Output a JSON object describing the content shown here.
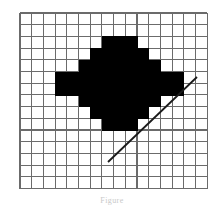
{
  "figure": {
    "caption": "Figure",
    "background_color": "#ffffff",
    "grid": {
      "line_color": "#6b6b6b",
      "line_width": 1.1,
      "origin_x": 20,
      "origin_y": 13,
      "cell_width": 11.7,
      "cell_height": 11.7,
      "columns": 16,
      "rows": 15
    },
    "shapes": [
      {
        "name": "rasterized-circle",
        "type": "filled-pixel-region",
        "fill_color": "#000000",
        "description": "Filled circular raster pattern, rows given as [row_index, start_col, end_col] inclusive in grid-cell coordinates",
        "pixel_rows": [
          [
            2,
            7,
            9
          ],
          [
            3,
            6,
            10
          ],
          [
            4,
            5,
            11
          ],
          [
            5,
            4,
            12
          ],
          [
            6,
            4,
            12
          ],
          [
            7,
            5,
            11
          ],
          [
            8,
            6,
            10
          ],
          [
            9,
            7,
            9
          ]
        ],
        "extra_cells": [
          [
            5,
            3
          ],
          [
            6,
            3
          ],
          [
            5,
            13
          ],
          [
            6,
            13
          ]
        ]
      },
      {
        "name": "diagonal-line",
        "type": "line",
        "stroke_color": "#1a1a1a",
        "stroke_width": 1.8,
        "x1": 108,
        "y1": 162,
        "x2": 197,
        "y2": 77
      }
    ]
  }
}
